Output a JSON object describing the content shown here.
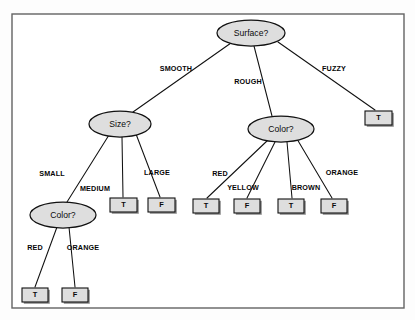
{
  "diagram": {
    "kind": "decision-tree",
    "colors": {
      "node_fill": "#dedede",
      "node_stroke": "#111111",
      "leaf_fill": "#dedede",
      "leaf_stroke": "#111111",
      "edge_stroke": "#111111",
      "frame_stroke": "#636363",
      "background": "#ffffff"
    },
    "frame": {
      "x": 12,
      "y": 14,
      "width": 392,
      "height": 294
    },
    "nodes": [
      {
        "id": "surface",
        "label": "Surface?",
        "type": "decision",
        "cx": 251,
        "cy": 33,
        "rx": 34,
        "ry": 13
      },
      {
        "id": "size",
        "label": "Size?",
        "type": "decision",
        "cx": 120,
        "cy": 124,
        "rx": 31,
        "ry": 13
      },
      {
        "id": "color_right",
        "label": "Color?",
        "type": "decision",
        "cx": 281,
        "cy": 129,
        "rx": 33,
        "ry": 13
      },
      {
        "id": "color_left",
        "label": "Color?",
        "type": "decision",
        "cx": 63,
        "cy": 215,
        "rx": 33,
        "ry": 13
      }
    ],
    "leaves": [
      {
        "id": "leaf_fuzzy_t",
        "label": "T",
        "x": 365,
        "y": 111,
        "width": 27,
        "height": 14
      },
      {
        "id": "leaf_medium_t",
        "label": "T",
        "x": 110,
        "y": 198,
        "width": 27,
        "height": 14
      },
      {
        "id": "leaf_large_f",
        "label": "F",
        "x": 148,
        "y": 198,
        "width": 27,
        "height": 14
      },
      {
        "id": "leaf_red_t",
        "label": "T",
        "x": 193,
        "y": 199,
        "width": 26,
        "height": 14
      },
      {
        "id": "leaf_yellow_f",
        "label": "F",
        "x": 234,
        "y": 199,
        "width": 26,
        "height": 14
      },
      {
        "id": "leaf_brown_t",
        "label": "T",
        "x": 278,
        "y": 199,
        "width": 26,
        "height": 14
      },
      {
        "id": "leaf_orange_f",
        "label": "F",
        "x": 321,
        "y": 199,
        "width": 26,
        "height": 14
      },
      {
        "id": "leaf_lred_t",
        "label": "T",
        "x": 22,
        "y": 288,
        "width": 26,
        "height": 14
      },
      {
        "id": "leaf_lorange_f",
        "label": "F",
        "x": 62,
        "y": 288,
        "width": 26,
        "height": 14
      }
    ],
    "edges": [
      {
        "id": "e_smooth",
        "from": "surface",
        "to": "size",
        "label": "SMOOTH",
        "x1": 231,
        "y1": 43,
        "x2": 133,
        "y2": 112,
        "lx": 176,
        "ly": 69
      },
      {
        "id": "e_rough",
        "from": "surface",
        "to": "color_right",
        "label": "ROUGH",
        "x1": 254,
        "y1": 46,
        "x2": 272,
        "y2": 116,
        "lx": 248,
        "ly": 82
      },
      {
        "id": "e_fuzzy",
        "from": "surface",
        "to": "leaf_fuzzy_t",
        "label": "FUZZY",
        "x1": 278,
        "y1": 42,
        "x2": 375,
        "y2": 110,
        "lx": 334,
        "ly": 69
      },
      {
        "id": "e_small",
        "from": "size",
        "to": "color_left",
        "label": "SMALL",
        "x1": 109,
        "y1": 135,
        "x2": 67,
        "y2": 202,
        "lx": 52,
        "ly": 174
      },
      {
        "id": "e_medium",
        "from": "size",
        "to": "leaf_medium_t",
        "label": "MEDIUM",
        "x1": 122,
        "y1": 137,
        "x2": 123,
        "y2": 197,
        "lx": 95,
        "ly": 189
      },
      {
        "id": "e_large",
        "from": "size",
        "to": "leaf_large_f",
        "label": "LARGE",
        "x1": 136,
        "y1": 134,
        "x2": 160,
        "y2": 197,
        "lx": 157,
        "ly": 173
      },
      {
        "id": "e_red",
        "from": "color_right",
        "to": "leaf_red_t",
        "label": "RED",
        "x1": 268,
        "y1": 140,
        "x2": 207,
        "y2": 198,
        "lx": 220,
        "ly": 174
      },
      {
        "id": "e_yellow",
        "from": "color_right",
        "to": "leaf_yellow_f",
        "label": "YELLOW",
        "x1": 275,
        "y1": 142,
        "x2": 247,
        "y2": 198,
        "lx": 243,
        "ly": 188
      },
      {
        "id": "e_brown",
        "from": "color_right",
        "to": "leaf_brown_t",
        "label": "BROWN",
        "x1": 287,
        "y1": 142,
        "x2": 292,
        "y2": 198,
        "lx": 306,
        "ly": 188
      },
      {
        "id": "e_orange",
        "from": "color_right",
        "to": "leaf_orange_f",
        "label": "ORANGE",
        "x1": 297,
        "y1": 139,
        "x2": 332,
        "y2": 198,
        "lx": 342,
        "ly": 173
      },
      {
        "id": "e_lred",
        "from": "color_left",
        "to": "leaf_lred_t",
        "label": "RED",
        "x1": 57,
        "y1": 227,
        "x2": 35,
        "y2": 287,
        "lx": 35,
        "ly": 248
      },
      {
        "id": "e_lorange",
        "from": "color_left",
        "to": "leaf_lorange_f",
        "label": "ORANGE",
        "x1": 69,
        "y1": 227,
        "x2": 75,
        "y2": 287,
        "lx": 83,
        "ly": 248
      }
    ]
  }
}
